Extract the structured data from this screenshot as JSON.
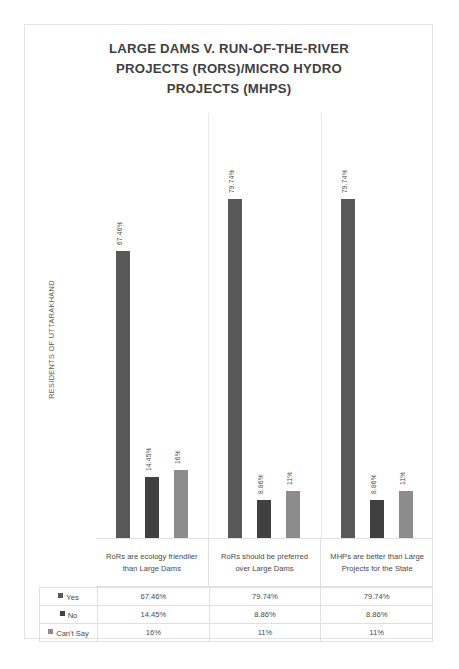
{
  "chart_data": {
    "type": "bar",
    "title": "LARGE DAMS V. RUN-OF-THE-RIVER PROJECTS (RORS)/MICRO HYDRO PROJECTS (MHPS)",
    "title_lines": [
      "LARGE DAMS V. RUN-OF-THE-RIVER",
      "PROJECTS (RORS)/MICRO HYDRO",
      "PROJECTS (MHPS)"
    ],
    "xlabel": "",
    "ylabel": "RESIDENTS OF UTTARAKHAND",
    "ylim": [
      0,
      100
    ],
    "grid": false,
    "legend_position": "table-row-header",
    "categories": [
      "RoRs are ecology friendlier than Large Dams",
      "RoRs should be preferred over Large Dams",
      "MHPs are better than Large Projects for the State"
    ],
    "series": [
      {
        "name": "Yes",
        "color": "#595959",
        "values": [
          67.46,
          79.74,
          79.74
        ],
        "labels": [
          "67.46%",
          "79.74%",
          "79.74%"
        ]
      },
      {
        "name": "No",
        "color": "#404040",
        "values": [
          14.45,
          8.86,
          8.86
        ],
        "labels": [
          "14.45%",
          "8.86%",
          "8.86%"
        ]
      },
      {
        "name": "Can't Say",
        "color": "#8c8c8c",
        "values": [
          16,
          11,
          11
        ],
        "labels": [
          "16%",
          "11%",
          "11%"
        ]
      }
    ]
  },
  "table": {
    "rows": [
      {
        "legend": "Yes",
        "color": "#595959",
        "cells": [
          "67.46%",
          "79.74%",
          "79.74%"
        ]
      },
      {
        "legend": "No",
        "color": "#404040",
        "cells": [
          "14.45%",
          "8.86%",
          "8.86%"
        ]
      },
      {
        "legend": "Can't Say",
        "color": "#8c8c8c",
        "cells": [
          "16%",
          "11%",
          "11%"
        ]
      }
    ]
  }
}
